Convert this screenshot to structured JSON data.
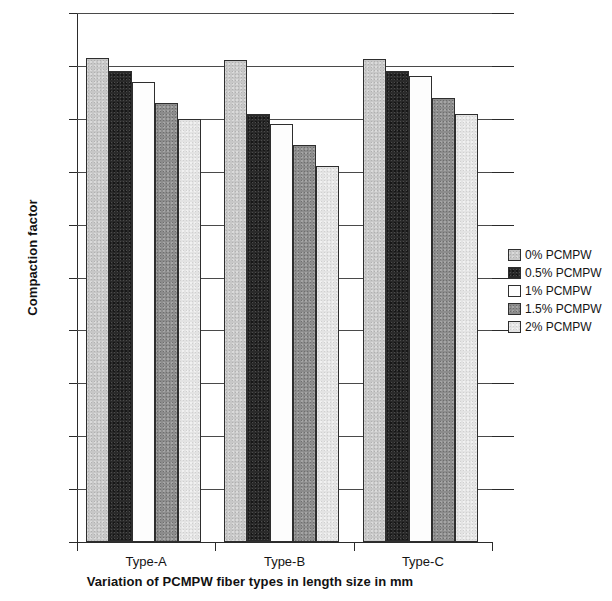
{
  "chart_data": {
    "type": "bar",
    "title": "",
    "xlabel": "Variation of PCMPW fiber types in length size in mm",
    "ylabel": "Compaction factor",
    "categories": [
      "Type-A",
      "Type-B",
      "Type-C"
    ],
    "ylim": [
      0,
      1
    ],
    "ytick_labels": [
      "0",
      "0.1",
      "0.2",
      "0.3",
      "0.4",
      "0.5",
      "0.6",
      "0.7",
      "0.8",
      "0.9",
      "1"
    ],
    "ytick_values": [
      0,
      0.1,
      0.2,
      0.3,
      0.4,
      0.5,
      0.6,
      0.7,
      0.8,
      0.9,
      1
    ],
    "grid": true,
    "legend_position": "right",
    "series": [
      {
        "name": "0% PCMPW",
        "color": "#c7c7c7",
        "values": [
          0.915,
          0.912,
          0.913
        ]
      },
      {
        "name": "0.5% PCMPW",
        "color": "#2a2a2a",
        "values": [
          0.89,
          0.81,
          0.89
        ]
      },
      {
        "name": "1% PCMPW",
        "color": "#fdfdfd",
        "values": [
          0.87,
          0.79,
          0.88
        ]
      },
      {
        "name": "1.5% PCMPW",
        "color": "#8c8c8c",
        "values": [
          0.83,
          0.75,
          0.84
        ]
      },
      {
        "name": "2% PCMPW",
        "color": "#e3e3e3",
        "values": [
          0.8,
          0.71,
          0.81
        ]
      }
    ]
  }
}
